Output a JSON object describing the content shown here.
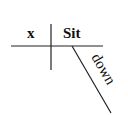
{
  "diagram": {
    "type": "sentence-diagram",
    "subject": "x",
    "verb": "Sit",
    "modifier": "down",
    "line_color": "#222222",
    "text_color": "#111111"
  }
}
